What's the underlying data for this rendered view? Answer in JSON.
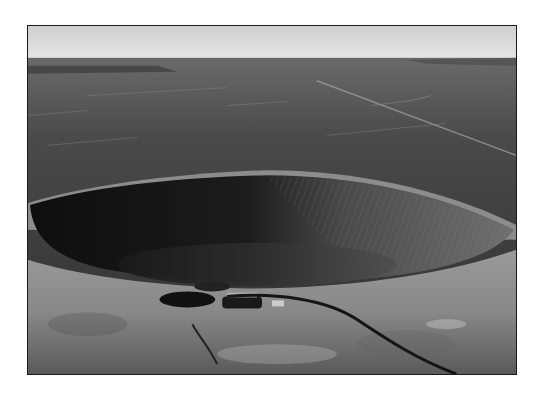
{
  "image": {
    "subject": "Aerial black-and-white photograph of a meteor impact crater in flat desert terrain",
    "style": "monochrome",
    "elements": {
      "sky": "hazy pale sky band at top",
      "plain": "dark flat desert plain stretching to horizon",
      "road": "straight road running diagonally across the upper right plain",
      "crater": "large bowl-shaped crater with shadowed left wall and sunlit ribbed right wall",
      "rim": "light-colored raised rim in foreground",
      "buildings": "small cluster of structures on the near rim",
      "foreground_road": "curving dark road descending to lower right"
    },
    "colors": {
      "page_background": "#ffffff",
      "frame_border": "#1a1a1a",
      "sky": "#d9d9d9",
      "plain_dark": "#3c3c3c",
      "crater_shadow": "#141414",
      "crater_lit_wall": "#6e6e6e",
      "rim_light": "#a8a8a8"
    }
  }
}
